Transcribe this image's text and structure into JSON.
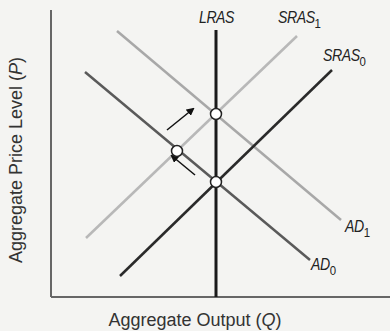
{
  "chart_data": {
    "type": "line",
    "title": "",
    "xlabel": "Aggregate Output (Q)",
    "ylabel": "Aggregate Price Level (P)",
    "grid": false,
    "series": [
      {
        "name": "LRAS",
        "kind": "vertical",
        "color": "#1a1a1a",
        "points": [
          [
            216,
            30
          ],
          [
            216,
            297
          ]
        ]
      },
      {
        "name": "SRAS1",
        "label_main": "SRAS",
        "label_sub": "1",
        "color": "#b8b8b8",
        "points": [
          [
            86,
            238
          ],
          [
            297,
            36
          ]
        ]
      },
      {
        "name": "SRAS0",
        "label_main": "SRAS",
        "label_sub": "0",
        "color": "#2a2a2a",
        "points": [
          [
            120,
            276
          ],
          [
            332,
            70
          ]
        ]
      },
      {
        "name": "AD1",
        "label_main": "AD",
        "label_sub": "1",
        "color": "#a8a8a8",
        "points": [
          [
            117,
            31
          ],
          [
            341,
            220
          ]
        ]
      },
      {
        "name": "AD0",
        "label_main": "AD",
        "label_sub": "0",
        "color": "#5a5a5a",
        "points": [
          [
            85,
            72
          ],
          [
            310,
            260
          ]
        ]
      }
    ],
    "equilibrium_points": [
      {
        "name": "LRAS-SRAS1-AD1",
        "x": 216,
        "y": 114
      },
      {
        "name": "SRAS0-AD1-intermediate",
        "x": 177,
        "y": 151
      },
      {
        "name": "LRAS-SRAS0-AD0",
        "x": 216,
        "y": 182
      }
    ],
    "arrows": [
      {
        "name": "shift-to-upper",
        "from": [
          167,
          130
        ],
        "to": [
          193,
          109
        ]
      },
      {
        "name": "shift-to-middle",
        "from": [
          195,
          175
        ],
        "to": [
          172,
          156
        ]
      }
    ]
  },
  "labels": {
    "lras": "LRAS",
    "sras1_main": "SRAS",
    "sras1_sub": "1",
    "sras0_main": "SRAS",
    "sras0_sub": "0",
    "ad1_main": "AD",
    "ad1_sub": "1",
    "ad0_main": "AD",
    "ad0_sub": "0",
    "y_axis": "Aggregate Price Level (P)",
    "x_axis": "Aggregate Output (Q)"
  }
}
